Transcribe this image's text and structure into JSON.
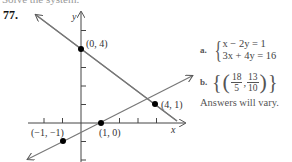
{
  "header": {
    "cut_text": "Solve the system.",
    "problem_number": "77."
  },
  "graph": {
    "y_axis_label": "y",
    "x_axis_label": "x",
    "points": [
      {
        "label": "(0, 4)",
        "x": 0,
        "y": 4
      },
      {
        "label": "(4, 1)",
        "x": 4,
        "y": 1
      },
      {
        "label": "(1, 0)",
        "x": 1,
        "y": 0
      },
      {
        "label": "(−1, −1)",
        "x": -1,
        "y": -1
      }
    ],
    "lines": [
      {
        "name": "decreasing",
        "through": [
          "(0, 4)",
          "(4, 1)"
        ]
      },
      {
        "name": "increasing",
        "through": [
          "(−1, −1)",
          "(1, 0)"
        ]
      }
    ]
  },
  "answers": {
    "a_letter": "a.",
    "eq1": "x − 2y = 1",
    "eq2": "3x + 4y = 16",
    "b_letter": "b.",
    "b_num1": "18",
    "b_den1": "5",
    "b_num2": "13",
    "b_den2": "10",
    "note": "Answers will vary."
  }
}
